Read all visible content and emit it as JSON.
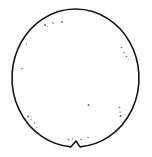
{
  "figure": {
    "name": "wafer-outline-diagram",
    "width": 152,
    "height": 157,
    "background_color": "#ffffff"
  },
  "wafer": {
    "shape": "circle-with-notch",
    "center_x": 75.5,
    "center_y": 78.0,
    "radius_x": 63.5,
    "radius_y": 69.0,
    "outline_color": "#151515",
    "outline_width": 1.6,
    "fill_color": "#ffffff",
    "notch": {
      "name": "wafer-notch",
      "position": "bottom-center",
      "center_x": 76.0,
      "width": 9.0,
      "depth": 6.0,
      "shape": "v-notch"
    }
  },
  "defects": {
    "label": "defect-specks",
    "count": 22,
    "color": "#3a3a3a",
    "points": [
      {
        "x": 45.0,
        "y": 25.0,
        "r": 0.9,
        "opacity": 0.85
      },
      {
        "x": 47.5,
        "y": 26.5,
        "r": 0.6,
        "opacity": 0.6
      },
      {
        "x": 53.0,
        "y": 23.0,
        "r": 0.8,
        "opacity": 0.8
      },
      {
        "x": 62.0,
        "y": 22.0,
        "r": 0.9,
        "opacity": 0.75
      },
      {
        "x": 26.5,
        "y": 44.0,
        "r": 0.7,
        "opacity": 0.55
      },
      {
        "x": 22.0,
        "y": 68.5,
        "r": 0.8,
        "opacity": 0.7
      },
      {
        "x": 121.5,
        "y": 47.5,
        "r": 0.8,
        "opacity": 0.8
      },
      {
        "x": 124.0,
        "y": 52.5,
        "r": 0.7,
        "opacity": 0.7
      },
      {
        "x": 126.5,
        "y": 56.5,
        "r": 0.8,
        "opacity": 0.75
      },
      {
        "x": 128.5,
        "y": 59.5,
        "r": 0.6,
        "opacity": 0.6
      },
      {
        "x": 88.5,
        "y": 105.0,
        "r": 0.9,
        "opacity": 0.8
      },
      {
        "x": 119.5,
        "y": 107.5,
        "r": 0.8,
        "opacity": 0.8
      },
      {
        "x": 120.0,
        "y": 112.0,
        "r": 0.7,
        "opacity": 0.7
      },
      {
        "x": 120.5,
        "y": 116.0,
        "r": 0.9,
        "opacity": 0.85
      },
      {
        "x": 28.0,
        "y": 116.5,
        "r": 0.9,
        "opacity": 0.8
      },
      {
        "x": 31.0,
        "y": 119.5,
        "r": 0.7,
        "opacity": 0.65
      },
      {
        "x": 34.5,
        "y": 123.0,
        "r": 0.8,
        "opacity": 0.7
      },
      {
        "x": 37.0,
        "y": 127.5,
        "r": 0.7,
        "opacity": 0.6
      },
      {
        "x": 68.5,
        "y": 139.5,
        "r": 0.8,
        "opacity": 0.8
      },
      {
        "x": 72.5,
        "y": 139.0,
        "r": 0.7,
        "opacity": 0.7
      },
      {
        "x": 81.0,
        "y": 139.5,
        "r": 0.8,
        "opacity": 0.75
      },
      {
        "x": 88.0,
        "y": 137.5,
        "r": 0.8,
        "opacity": 0.7
      }
    ]
  }
}
